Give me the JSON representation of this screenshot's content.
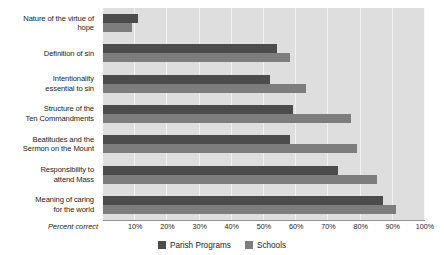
{
  "chart_data": {
    "type": "bar",
    "orientation": "horizontal",
    "title": "",
    "xlabel": "Percent correct",
    "ylabel": "",
    "xlim": [
      0,
      100
    ],
    "grid": true,
    "legend_position": "bottom-center",
    "categories": [
      "Nature of the virtue of hope",
      "Definition of sin",
      "Intentionality essential to sin",
      "Structure of the Ten Commandments",
      "Beatitudes and the Sermon on the Mount",
      "Responsibility to attend Mass",
      "Meaning of caring for the world"
    ],
    "category_lines": [
      [
        "Nature of the virtue of",
        "hope"
      ],
      [
        "Definition of sin"
      ],
      [
        "Intentionality",
        "essential to sin"
      ],
      [
        "Structure of the",
        "Ten Commandments"
      ],
      [
        "Beatitudes and the",
        "Sermon on the Mount"
      ],
      [
        "Responsibility to",
        "attend Mass"
      ],
      [
        "Meaning of caring",
        "for the world"
      ]
    ],
    "series": [
      {
        "name": "Parish Programs",
        "color": "#4c4c4c",
        "values": [
          11,
          54,
          52,
          59,
          58,
          73,
          87
        ]
      },
      {
        "name": "Schools",
        "color": "#7d7d7d",
        "values": [
          9,
          58,
          63,
          77,
          79,
          85,
          91
        ]
      }
    ],
    "xticks": [
      10,
      20,
      30,
      40,
      50,
      60,
      70,
      80,
      90,
      100
    ],
    "xtick_labels": [
      "10%",
      "20%",
      "30%",
      "40%",
      "50%",
      "60%",
      "70%",
      "80%",
      "90%",
      "100%"
    ]
  },
  "axis": {
    "percent_correct_label": "Percent correct"
  },
  "legend": {
    "items": [
      {
        "label": "Parish Programs",
        "color": "#4c4c4c"
      },
      {
        "label": "Schools",
        "color": "#7d7d7d"
      }
    ]
  },
  "colors": {
    "plot_background": "#dedede",
    "gridline": "#f2f2f2",
    "axis_line": "#8f8f8f",
    "text": "#1b1b1b",
    "parish_programs": "#4c4c4c",
    "schools": "#7d7d7d"
  }
}
